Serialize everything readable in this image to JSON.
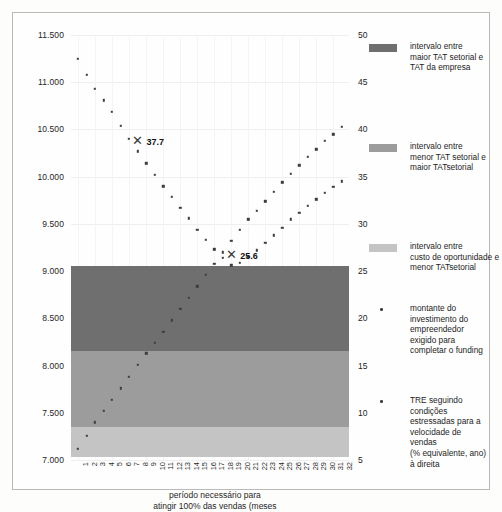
{
  "chart_data": {
    "type": "scatter",
    "title": "",
    "xlabel": "período necessário para\natingir 100% das vendas (meses",
    "ylabel_left": "",
    "ylabel_right": "",
    "xlim": [
      1,
      32
    ],
    "ylim_left": [
      7000,
      11500
    ],
    "ylim_right": [
      5,
      50
    ],
    "grid": true,
    "legend_position": "right",
    "x": [
      1,
      2,
      3,
      4,
      5,
      6,
      7,
      8,
      9,
      10,
      11,
      12,
      13,
      14,
      15,
      16,
      17,
      18,
      19,
      20,
      21,
      22,
      23,
      24,
      25,
      26,
      27,
      28,
      29,
      30,
      31,
      32
    ],
    "xtick_labels": [
      "1",
      "2",
      "3",
      "4",
      "5",
      "6",
      "7",
      "8",
      "9",
      "10",
      "11",
      "12",
      "13",
      "14",
      "15",
      "16",
      "17",
      "18",
      "19",
      "20",
      "21",
      "22",
      "23",
      "24",
      "25",
      "26",
      "27",
      "28",
      "29",
      "30",
      "31",
      "32"
    ],
    "ytick_labels_left": [
      "11.500",
      "11.000",
      "10.500",
      "10.000",
      "9.500",
      "9.000",
      "8.500",
      "8.000",
      "7.500",
      "7.000"
    ],
    "ytick_values_left": [
      11500,
      11000,
      10500,
      10000,
      9500,
      9000,
      8500,
      8000,
      7500,
      7000
    ],
    "ytick_labels_right": [
      "50",
      "45",
      "40",
      "35",
      "30",
      "25",
      "20",
      "15",
      "10",
      "5"
    ],
    "ytick_values_right": [
      50,
      45,
      40,
      35,
      30,
      25,
      20,
      15,
      10,
      5
    ],
    "series": [
      {
        "name": "montante do investimento do empreendedor exigido para completar o funding",
        "axis": "left",
        "marker": "square",
        "color": "#3d3d3d",
        "values": [
          7120,
          7255,
          7400,
          7520,
          7640,
          7760,
          7880,
          8005,
          8130,
          8240,
          8360,
          8480,
          8600,
          8720,
          8840,
          8960,
          9080,
          9200,
          9320,
          9440,
          9550,
          9640,
          9740,
          9840,
          9940,
          10030,
          10120,
          10210,
          10290,
          10380,
          10450,
          10530
        ]
      },
      {
        "name": "TRE seguindo condições estressadas para a velocidade de vendas (% equivalente, ano) à direita",
        "axis": "right",
        "marker": "square",
        "color": "#3d3d3d",
        "values": [
          47.5,
          45.8,
          44.3,
          43.1,
          41.9,
          40.4,
          39.0,
          37.7,
          36.4,
          35.2,
          34.0,
          32.9,
          31.7,
          30.6,
          29.4,
          28.3,
          27.3,
          26.4,
          25.6,
          25.9,
          26.5,
          27.2,
          28.0,
          28.8,
          29.6,
          30.5,
          31.2,
          31.9,
          32.6,
          33.3,
          33.9,
          34.5
        ]
      }
    ],
    "annotations": [
      {
        "label": "37.7",
        "x": 8,
        "y_right": 37.7,
        "marker": "x"
      },
      {
        "label": "25.6",
        "x": 19,
        "y_right": 25.6,
        "marker": "x"
      }
    ],
    "bands": [
      {
        "name": "intervalo entre maior TAT setorial e TAT da empresa",
        "from": 8150,
        "to": 9050,
        "color": "#6f6f6f"
      },
      {
        "name": "intervalo entre menor TAT setorial e maior TATsetorial",
        "from": 7350,
        "to": 8150,
        "color": "#9c9c9c"
      },
      {
        "name": "intervalo entre custo de oportunidade e menor TATsetorial",
        "from": 7030,
        "to": 7350,
        "color": "#c4c4c4"
      }
    ]
  },
  "legend": {
    "items": [
      {
        "kind": "swatch",
        "color": "#6f6f6f",
        "text": "intervalo entre\nmaior TAT setorial e\nTAT da empresa"
      },
      {
        "kind": "swatch",
        "color": "#9c9c9c",
        "text": "intervalo entre\nmenor TAT setorial e\nmaior TATsetorial"
      },
      {
        "kind": "swatch",
        "color": "#c4c4c4",
        "text": "intervalo entre\ncusto de oportunidade e\nmenor TATsetorial"
      },
      {
        "kind": "dot",
        "color": "#3d3d3d",
        "text": "montante do\ninvestimento do\nempreendedor\nexigido para\ncompletar o funding"
      },
      {
        "kind": "dot",
        "color": "#3d3d3d",
        "text": "TRE seguindo condições\nestressadas para a\nvelocidade de\nvendas\n(% equivalente, ano)\nà direita"
      }
    ]
  },
  "axis_title": {
    "line1": "período necessário para",
    "line2": "atingir 100% das vendas (meses"
  }
}
